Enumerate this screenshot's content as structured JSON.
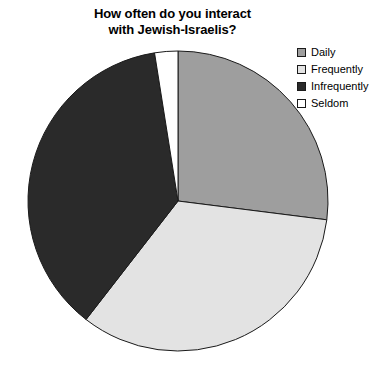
{
  "chart_data": {
    "type": "pie",
    "title": "How often do you interact\nwith Jewish-Israelis?",
    "title_line1": "How often do you interact",
    "title_line2": "with Jewish-Israelis?",
    "xlabel": "",
    "ylabel": "",
    "grid": false,
    "legend_position": "top-right",
    "start_angle_deg": 0,
    "direction": "clockwise",
    "categories": [
      "Daily",
      "Frequently",
      "Infrequently",
      "Seldom"
    ],
    "values": [
      27,
      33.5,
      37,
      2.5
    ],
    "units": "percent",
    "colors": [
      "#9e9e9e",
      "#e3e3e3",
      "#2a2a2a",
      "#ffffff"
    ],
    "slice_edge_color": "#1a1a1a",
    "slices": [
      {
        "label": "Daily",
        "value": 27,
        "color": "#9e9e9e",
        "start_deg": 0,
        "end_deg": 97.2
      },
      {
        "label": "Frequently",
        "value": 33.5,
        "color": "#e3e3e3",
        "start_deg": 97.2,
        "end_deg": 217.8
      },
      {
        "label": "Infrequently",
        "value": 37,
        "color": "#2a2a2a",
        "start_deg": 217.8,
        "end_deg": 351.0
      },
      {
        "label": "Seldom",
        "value": 2.5,
        "color": "#ffffff",
        "start_deg": 351.0,
        "end_deg": 360.0
      }
    ],
    "geometry": {
      "cx": 178,
      "cy": 201,
      "r": 150
    }
  },
  "legend": {
    "items": [
      {
        "label": "Daily",
        "color": "#9e9e9e"
      },
      {
        "label": "Frequently",
        "color": "#e3e3e3"
      },
      {
        "label": "Infrequently",
        "color": "#2a2a2a"
      },
      {
        "label": "Seldom",
        "color": "#ffffff"
      }
    ]
  }
}
